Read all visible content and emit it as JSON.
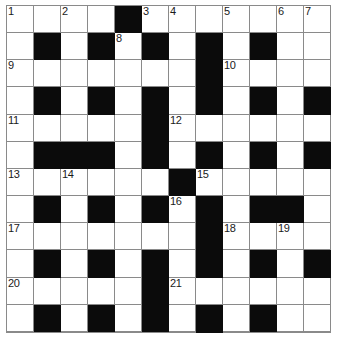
{
  "puzzle": {
    "type": "crossword-grid",
    "rows": 12,
    "columns": 12,
    "cell_size_px": 27,
    "colors": {
      "block": "#0b0b0b",
      "open": "#ffffff",
      "gridline": "#8a8a8a",
      "number_text": "#1a1a1a"
    },
    "numbers_visible": [
      "1",
      "2",
      "3",
      "4",
      "5",
      "6",
      "7",
      "8",
      "9",
      "10",
      "11",
      "12",
      "13",
      "14",
      "15",
      "16",
      "17",
      "18",
      "19",
      "20",
      "21",
      "22",
      "23"
    ],
    "grid": [
      [
        {
          "block": false,
          "num": "1",
          "letter": ""
        },
        {
          "block": false,
          "num": "",
          "letter": ""
        },
        {
          "block": false,
          "num": "2",
          "letter": ""
        },
        {
          "block": false,
          "num": "",
          "letter": ""
        },
        {
          "block": true,
          "num": "",
          "letter": ""
        },
        {
          "block": false,
          "num": "3",
          "letter": ""
        },
        {
          "block": false,
          "num": "4",
          "letter": ""
        },
        {
          "block": false,
          "num": "",
          "letter": ""
        },
        {
          "block": false,
          "num": "5",
          "letter": ""
        },
        {
          "block": false,
          "num": "",
          "letter": ""
        },
        {
          "block": false,
          "num": "6",
          "letter": ""
        },
        {
          "block": false,
          "num": "7",
          "letter": ""
        }
      ],
      [
        {
          "block": false,
          "num": "",
          "letter": ""
        },
        {
          "block": true,
          "num": "",
          "letter": ""
        },
        {
          "block": false,
          "num": "",
          "letter": ""
        },
        {
          "block": true,
          "num": "",
          "letter": ""
        },
        {
          "block": false,
          "num": "8",
          "letter": ""
        },
        {
          "block": true,
          "num": "",
          "letter": ""
        },
        {
          "block": false,
          "num": "",
          "letter": ""
        },
        {
          "block": true,
          "num": "",
          "letter": ""
        },
        {
          "block": false,
          "num": "",
          "letter": ""
        },
        {
          "block": true,
          "num": "",
          "letter": ""
        },
        {
          "block": false,
          "num": "",
          "letter": ""
        },
        {
          "block": false,
          "num": "",
          "letter": ""
        }
      ],
      [
        {
          "block": false,
          "num": "9",
          "letter": ""
        },
        {
          "block": false,
          "num": "",
          "letter": ""
        },
        {
          "block": false,
          "num": "",
          "letter": ""
        },
        {
          "block": false,
          "num": "",
          "letter": ""
        },
        {
          "block": false,
          "num": "",
          "letter": ""
        },
        {
          "block": false,
          "num": "",
          "letter": ""
        },
        {
          "block": false,
          "num": "",
          "letter": ""
        },
        {
          "block": true,
          "num": "",
          "letter": ""
        },
        {
          "block": false,
          "num": "10",
          "letter": ""
        },
        {
          "block": false,
          "num": "",
          "letter": ""
        },
        {
          "block": false,
          "num": "",
          "letter": ""
        },
        {
          "block": false,
          "num": "",
          "letter": ""
        }
      ],
      [
        {
          "block": false,
          "num": "",
          "letter": ""
        },
        {
          "block": true,
          "num": "",
          "letter": ""
        },
        {
          "block": false,
          "num": "",
          "letter": ""
        },
        {
          "block": true,
          "num": "",
          "letter": ""
        },
        {
          "block": false,
          "num": "",
          "letter": ""
        },
        {
          "block": true,
          "num": "",
          "letter": ""
        },
        {
          "block": false,
          "num": "",
          "letter": ""
        },
        {
          "block": true,
          "num": "",
          "letter": ""
        },
        {
          "block": false,
          "num": "",
          "letter": ""
        },
        {
          "block": true,
          "num": "",
          "letter": ""
        },
        {
          "block": false,
          "num": "",
          "letter": ""
        },
        {
          "block": true,
          "num": "",
          "letter": ""
        }
      ],
      [
        {
          "block": false,
          "num": "11",
          "letter": ""
        },
        {
          "block": false,
          "num": "",
          "letter": ""
        },
        {
          "block": false,
          "num": "",
          "letter": ""
        },
        {
          "block": false,
          "num": "",
          "letter": ""
        },
        {
          "block": false,
          "num": "",
          "letter": ""
        },
        {
          "block": true,
          "num": "",
          "letter": ""
        },
        {
          "block": false,
          "num": "12",
          "letter": ""
        },
        {
          "block": false,
          "num": "",
          "letter": ""
        },
        {
          "block": false,
          "num": "",
          "letter": ""
        },
        {
          "block": false,
          "num": "",
          "letter": ""
        },
        {
          "block": false,
          "num": "",
          "letter": ""
        },
        {
          "block": false,
          "num": "",
          "letter": ""
        }
      ],
      [
        {
          "block": false,
          "num": "",
          "letter": ""
        },
        {
          "block": true,
          "num": "",
          "letter": ""
        },
        {
          "block": true,
          "num": "",
          "letter": ""
        },
        {
          "block": true,
          "num": "",
          "letter": ""
        },
        {
          "block": false,
          "num": "",
          "letter": ""
        },
        {
          "block": true,
          "num": "",
          "letter": ""
        },
        {
          "block": false,
          "num": "",
          "letter": ""
        },
        {
          "block": true,
          "num": "",
          "letter": ""
        },
        {
          "block": false,
          "num": "",
          "letter": ""
        },
        {
          "block": true,
          "num": "",
          "letter": ""
        },
        {
          "block": false,
          "num": "",
          "letter": ""
        },
        {
          "block": true,
          "num": "",
          "letter": ""
        }
      ],
      [
        {
          "block": false,
          "num": "13",
          "letter": ""
        },
        {
          "block": false,
          "num": "",
          "letter": ""
        },
        {
          "block": false,
          "num": "14",
          "letter": ""
        },
        {
          "block": false,
          "num": "",
          "letter": ""
        },
        {
          "block": false,
          "num": "",
          "letter": ""
        },
        {
          "block": false,
          "num": "",
          "letter": ""
        },
        {
          "block": true,
          "num": "",
          "letter": ""
        },
        {
          "block": false,
          "num": "15",
          "letter": ""
        },
        {
          "block": false,
          "num": "",
          "letter": ""
        },
        {
          "block": false,
          "num": "",
          "letter": ""
        },
        {
          "block": false,
          "num": "",
          "letter": ""
        },
        {
          "block": false,
          "num": "",
          "letter": ""
        }
      ],
      [
        {
          "block": false,
          "num": "",
          "letter": ""
        },
        {
          "block": true,
          "num": "",
          "letter": ""
        },
        {
          "block": false,
          "num": "",
          "letter": ""
        },
        {
          "block": true,
          "num": "",
          "letter": ""
        },
        {
          "block": false,
          "num": "",
          "letter": ""
        },
        {
          "block": true,
          "num": "",
          "letter": ""
        },
        {
          "block": false,
          "num": "16",
          "letter": ""
        },
        {
          "block": true,
          "num": "",
          "letter": ""
        },
        {
          "block": false,
          "num": "",
          "letter": ""
        },
        {
          "block": true,
          "num": "",
          "letter": ""
        },
        {
          "block": true,
          "num": "",
          "letter": ""
        },
        {
          "block": false,
          "num": "",
          "letter": ""
        }
      ],
      [
        {
          "block": false,
          "num": "17",
          "letter": ""
        },
        {
          "block": false,
          "num": "",
          "letter": ""
        },
        {
          "block": false,
          "num": "",
          "letter": ""
        },
        {
          "block": false,
          "num": "",
          "letter": ""
        },
        {
          "block": false,
          "num": "",
          "letter": ""
        },
        {
          "block": false,
          "num": "",
          "letter": ""
        },
        {
          "block": false,
          "num": "",
          "letter": ""
        },
        {
          "block": true,
          "num": "",
          "letter": ""
        },
        {
          "block": false,
          "num": "18",
          "letter": ""
        },
        {
          "block": false,
          "num": "",
          "letter": ""
        },
        {
          "block": false,
          "num": "19",
          "letter": ""
        },
        {
          "block": false,
          "num": "",
          "letter": ""
        }
      ],
      [
        {
          "block": false,
          "num": "",
          "letter": ""
        },
        {
          "block": true,
          "num": "",
          "letter": ""
        },
        {
          "block": false,
          "num": "",
          "letter": ""
        },
        {
          "block": true,
          "num": "",
          "letter": ""
        },
        {
          "block": false,
          "num": "",
          "letter": ""
        },
        {
          "block": true,
          "num": "",
          "letter": ""
        },
        {
          "block": false,
          "num": "",
          "letter": ""
        },
        {
          "block": true,
          "num": "",
          "letter": ""
        },
        {
          "block": false,
          "num": "",
          "letter": ""
        },
        {
          "block": true,
          "num": "",
          "letter": ""
        },
        {
          "block": false,
          "num": "",
          "letter": ""
        },
        {
          "block": true,
          "num": "",
          "letter": ""
        }
      ],
      [
        {
          "block": false,
          "num": "20",
          "letter": ""
        },
        {
          "block": false,
          "num": "",
          "letter": ""
        },
        {
          "block": false,
          "num": "",
          "letter": ""
        },
        {
          "block": false,
          "num": "",
          "letter": ""
        },
        {
          "block": false,
          "num": "",
          "letter": ""
        },
        {
          "block": true,
          "num": "",
          "letter": ""
        },
        {
          "block": false,
          "num": "21",
          "letter": ""
        },
        {
          "block": false,
          "num": "",
          "letter": ""
        },
        {
          "block": false,
          "num": "",
          "letter": ""
        },
        {
          "block": false,
          "num": "",
          "letter": ""
        },
        {
          "block": false,
          "num": "",
          "letter": ""
        },
        {
          "block": false,
          "num": "",
          "letter": ""
        }
      ],
      [
        {
          "block": false,
          "num": "",
          "letter": ""
        },
        {
          "block": true,
          "num": "",
          "letter": ""
        },
        {
          "block": false,
          "num": "",
          "letter": ""
        },
        {
          "block": true,
          "num": "",
          "letter": ""
        },
        {
          "block": false,
          "num": "",
          "letter": ""
        },
        {
          "block": true,
          "num": "",
          "letter": ""
        },
        {
          "block": false,
          "num": "",
          "letter": ""
        },
        {
          "block": true,
          "num": "",
          "letter": ""
        },
        {
          "block": false,
          "num": "",
          "letter": ""
        },
        {
          "block": true,
          "num": "",
          "letter": ""
        },
        {
          "block": false,
          "num": "",
          "letter": ""
        },
        {
          "block": false,
          "num": "",
          "letter": ""
        }
      ],
      [
        {
          "block": false,
          "num": "22",
          "letter": ""
        },
        {
          "block": false,
          "num": "",
          "letter": ""
        },
        {
          "block": false,
          "num": "",
          "letter": ""
        },
        {
          "block": false,
          "num": "",
          "letter": ""
        },
        {
          "block": false,
          "num": "",
          "letter": ""
        },
        {
          "block": false,
          "num": "",
          "letter": ""
        },
        {
          "block": false,
          "num": "",
          "letter": ""
        },
        {
          "block": true,
          "num": "",
          "letter": ""
        },
        {
          "block": false,
          "num": "23",
          "letter": ""
        },
        {
          "block": false,
          "num": "",
          "letter": ""
        },
        {
          "block": false,
          "num": "",
          "letter": ""
        },
        {
          "block": false,
          "num": "",
          "letter": ""
        }
      ]
    ]
  }
}
